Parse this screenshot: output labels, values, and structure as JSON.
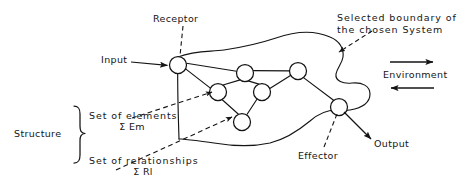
{
  "diagram": {
    "title_absent": true,
    "labels": {
      "receptor": "Receptor",
      "input": "Input",
      "boundary_line1": "Selected boundary of",
      "boundary_line2": "the chosen System",
      "environment": "Environment",
      "structure": "Structure",
      "elements_line1": "Set of elements",
      "elements_line2": "Σ Em",
      "relationships_line1": "Set of relationships",
      "relationships_line2": "Σ Rl",
      "output": "Output",
      "effector": "Effector"
    },
    "colors": {
      "ink": "#141414",
      "background": "#ffffff",
      "node_fill": "#ffffff"
    },
    "nodes": [
      {
        "id": "receptor",
        "cx": 178,
        "cy": 65,
        "r": 8.5,
        "role": "receptor"
      },
      {
        "id": "n_a",
        "cx": 218,
        "cy": 92,
        "r": 8.5,
        "role": "element"
      },
      {
        "id": "n_b",
        "cx": 245,
        "cy": 73,
        "r": 8.5,
        "role": "element"
      },
      {
        "id": "n_c",
        "cx": 262,
        "cy": 92,
        "r": 8.5,
        "role": "element"
      },
      {
        "id": "n_d",
        "cx": 242,
        "cy": 122,
        "r": 8.5,
        "role": "element"
      },
      {
        "id": "n_e",
        "cx": 298,
        "cy": 71,
        "r": 8.5,
        "role": "element"
      },
      {
        "id": "effector",
        "cx": 339,
        "cy": 107,
        "r": 8.5,
        "role": "effector"
      }
    ],
    "edges": [
      {
        "from": "receptor",
        "to": "n_a"
      },
      {
        "from": "receptor",
        "to": "n_b"
      },
      {
        "from": "n_a",
        "to": "n_b"
      },
      {
        "from": "n_a",
        "to": "n_d"
      },
      {
        "from": "n_b",
        "to": "n_c"
      },
      {
        "from": "n_b",
        "to": "n_e"
      },
      {
        "from": "n_c",
        "to": "n_d"
      },
      {
        "from": "n_c",
        "to": "n_e"
      },
      {
        "from": "n_e",
        "to": "effector"
      }
    ],
    "environment_arrows": [
      {
        "direction": "right",
        "x1": 390,
        "x2": 434,
        "y": 62
      },
      {
        "direction": "left",
        "x1": 434,
        "x2": 390,
        "y": 88
      }
    ]
  }
}
